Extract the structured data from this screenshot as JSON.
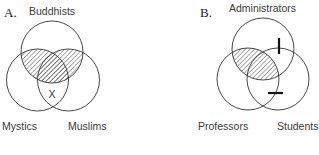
{
  "diagrams": [
    {
      "letter": "A.",
      "circles": [
        {
          "label": "Buddhists",
          "cx": 52,
          "cy": 52,
          "r": 31
        },
        {
          "label": "Mystics",
          "cx": 37.5,
          "cy": 80,
          "r": 31
        },
        {
          "label": "Muslims",
          "cx": 68.5,
          "cy": 80,
          "r": 31
        }
      ],
      "shaded_region": "Buddhists ∩ (Mystics ∪ Muslims) — upper overlap",
      "mark": "X"
    },
    {
      "letter": "B.",
      "circles": [
        {
          "label": "Administrators",
          "cx": 263,
          "cy": 49,
          "r": 31
        },
        {
          "label": "Professors",
          "cx": 248,
          "cy": 79,
          "r": 31
        },
        {
          "label": "Students",
          "cx": 278,
          "cy": 79,
          "r": 31
        }
      ],
      "shaded_region": "Administrators ∩ Professors",
      "marks": [
        "vertical bar on Administrators/Students boundary",
        "horizontal bar on Students/Professors boundary"
      ]
    }
  ],
  "colors": {
    "stroke": "#333333",
    "text": "#3a3a3a",
    "background": "#ffffff"
  }
}
